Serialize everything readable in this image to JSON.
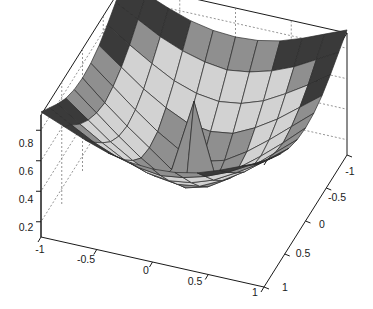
{
  "chart_data": {
    "type": "surface",
    "title": "",
    "subtitle": "",
    "xlabel": "",
    "ylabel": "",
    "zlabel": "",
    "grid": true,
    "legend": false,
    "legend_position": "none",
    "projection": "3d",
    "view": {
      "azimuth": -37.5,
      "elevation": 30
    },
    "xlim": [
      -1,
      1
    ],
    "ylim": [
      -1,
      1
    ],
    "zlim": [
      0.1,
      0.9
    ],
    "xticks": [
      -1,
      -0.5,
      0,
      0.5,
      1
    ],
    "xtick_labels": [
      "-1",
      "-0.5",
      "0",
      "0.5",
      "1"
    ],
    "yticks": [
      -1,
      -0.5,
      0,
      0.5,
      1
    ],
    "ytick_labels": [
      "-1",
      "-0.5",
      "0",
      "0.5",
      "1"
    ],
    "zticks": [
      0.2,
      0.4,
      0.6,
      0.8
    ],
    "ztick_labels": [
      "0.2",
      "0.4",
      "0.6",
      "0.8"
    ],
    "colormap": "gray",
    "shading": "faceted",
    "x": [
      -1,
      -0.8,
      -0.6,
      -0.4,
      -0.2,
      0,
      0.2,
      0.4,
      0.6,
      0.8,
      1
    ],
    "y": [
      -1,
      -0.8,
      -0.6,
      -0.4,
      -0.2,
      0,
      0.2,
      0.4,
      0.6,
      0.8,
      1
    ],
    "z": [
      [
        0.92,
        0.86,
        0.8,
        0.75,
        0.72,
        0.71,
        0.72,
        0.75,
        0.8,
        0.86,
        0.92
      ],
      [
        0.86,
        0.78,
        0.7,
        0.64,
        0.6,
        0.58,
        0.6,
        0.64,
        0.7,
        0.78,
        0.86
      ],
      [
        0.8,
        0.7,
        0.61,
        0.53,
        0.48,
        0.46,
        0.48,
        0.53,
        0.61,
        0.7,
        0.8
      ],
      [
        0.75,
        0.64,
        0.53,
        0.44,
        0.37,
        0.35,
        0.37,
        0.44,
        0.53,
        0.64,
        0.75
      ],
      [
        0.72,
        0.6,
        0.48,
        0.37,
        0.28,
        0.24,
        0.28,
        0.37,
        0.48,
        0.6,
        0.72
      ],
      [
        0.71,
        0.58,
        0.46,
        0.35,
        0.24,
        0.72,
        0.24,
        0.35,
        0.46,
        0.58,
        0.71
      ],
      [
        0.72,
        0.6,
        0.48,
        0.37,
        0.28,
        0.24,
        0.28,
        0.37,
        0.48,
        0.6,
        0.72
      ],
      [
        0.75,
        0.64,
        0.53,
        0.44,
        0.37,
        0.35,
        0.37,
        0.44,
        0.53,
        0.64,
        0.75
      ],
      [
        0.8,
        0.7,
        0.61,
        0.53,
        0.48,
        0.46,
        0.48,
        0.53,
        0.61,
        0.7,
        0.8
      ],
      [
        0.86,
        0.78,
        0.7,
        0.64,
        0.6,
        0.58,
        0.6,
        0.64,
        0.7,
        0.78,
        0.86
      ],
      [
        0.92,
        0.86,
        0.8,
        0.75,
        0.72,
        0.71,
        0.72,
        0.75,
        0.8,
        0.86,
        0.92
      ]
    ],
    "colors": {
      "surface_light": "#d2d2d2",
      "surface_mid": "#8f8f8f",
      "surface_dark": "#3a3a3a",
      "mesh_line": "#2b2b2b",
      "axis_line": "#1a1a1a",
      "grid_line": "#7a7a7a",
      "background": "#ffffff",
      "tick_text": "#1a1a1a"
    }
  },
  "axes": {
    "z_axis": {
      "name": "z-axis",
      "ticks": [
        {
          "label": "0.8",
          "x": 26,
          "y": 147
        },
        {
          "label": "0.6",
          "x": 26,
          "y": 175
        },
        {
          "label": "0.4",
          "x": 26,
          "y": 203
        },
        {
          "label": "0.2",
          "x": 26,
          "y": 231
        }
      ]
    },
    "x_axis": {
      "name": "x-axis",
      "ticks": [
        {
          "label": "-1",
          "x": 40,
          "y": 253
        },
        {
          "label": "-0.5",
          "x": 86,
          "y": 263
        },
        {
          "label": "0",
          "x": 146,
          "y": 274
        },
        {
          "label": "0.5",
          "x": 195,
          "y": 285
        },
        {
          "label": "1",
          "x": 255,
          "y": 296
        }
      ]
    },
    "y_axis": {
      "name": "y-axis",
      "ticks": [
        {
          "label": "-1",
          "x": 350,
          "y": 175
        },
        {
          "label": "-0.5",
          "x": 337,
          "y": 201
        },
        {
          "label": "0",
          "x": 322,
          "y": 228
        },
        {
          "label": "0.5",
          "x": 303,
          "y": 257
        },
        {
          "label": "1",
          "x": 285,
          "y": 291
        }
      ]
    }
  },
  "figure": {
    "width": 373,
    "height": 309
  }
}
